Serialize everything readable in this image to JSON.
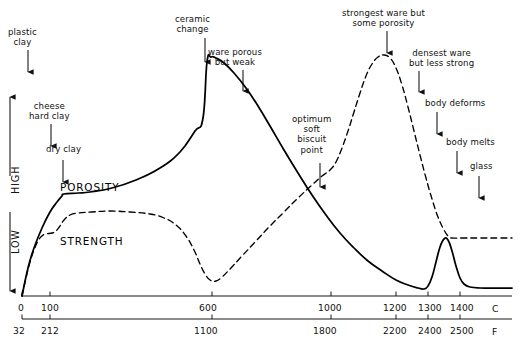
{
  "chart_data": {
    "type": "line",
    "title": "",
    "xlabel": "",
    "ylabel": "",
    "grid": false,
    "legend_position": "inline-curve-labels",
    "axes": {
      "x_primary": {
        "unit": "C",
        "ticks": [
          0,
          100,
          600,
          1000,
          1200,
          1300,
          1400
        ],
        "tick_labels": [
          "0",
          "100",
          "600",
          "1000",
          "1200",
          "1300",
          "1400"
        ],
        "range": [
          -40,
          1500
        ]
      },
      "x_secondary": {
        "unit": "F",
        "ticks": [
          32,
          212,
          1100,
          1800,
          2200,
          2400,
          2500
        ],
        "tick_labels": [
          "32",
          "212",
          "1100",
          "1800",
          "2200",
          "2400",
          "2500"
        ]
      },
      "y": {
        "low_label": "LOW",
        "high_label": "HIGH",
        "range": [
          0,
          1
        ]
      }
    },
    "series": [
      {
        "name": "POROSITY",
        "style": "solid",
        "color": "#000000",
        "label_x": 60,
        "label_y": 181,
        "points": [
          [
            22,
            296
          ],
          [
            28,
            268
          ],
          [
            34,
            248
          ],
          [
            42,
            228
          ],
          [
            50,
            212
          ],
          [
            57,
            202
          ],
          [
            62,
            196
          ],
          [
            64,
            194
          ],
          [
            78,
            193
          ],
          [
            90,
            192
          ],
          [
            112,
            188
          ],
          [
            136,
            180
          ],
          [
            160,
            168
          ],
          [
            180,
            152
          ],
          [
            195,
            131
          ],
          [
            203,
            118
          ],
          [
            207,
            62
          ],
          [
            211,
            57
          ],
          [
            216,
            58
          ],
          [
            224,
            63
          ],
          [
            234,
            73
          ],
          [
            246,
            88
          ],
          [
            258,
            106
          ],
          [
            270,
            126
          ],
          [
            284,
            150
          ],
          [
            298,
            173
          ],
          [
            312,
            195
          ],
          [
            326,
            215
          ],
          [
            340,
            233
          ],
          [
            354,
            248
          ],
          [
            368,
            261
          ],
          [
            382,
            271
          ],
          [
            396,
            280
          ],
          [
            408,
            285
          ],
          [
            418,
            288
          ],
          [
            424,
            289
          ],
          [
            428,
            286
          ],
          [
            432,
            277
          ],
          [
            436,
            262
          ],
          [
            440,
            247
          ],
          [
            444,
            239
          ],
          [
            448,
            240
          ],
          [
            452,
            251
          ],
          [
            456,
            266
          ],
          [
            460,
            278
          ],
          [
            464,
            284
          ],
          [
            470,
            287
          ],
          [
            480,
            288
          ],
          [
            495,
            288
          ],
          [
            512,
            288
          ]
        ]
      },
      {
        "name": "STRENGTH",
        "style": "dashed",
        "color": "#000000",
        "label_x": 60,
        "label_y": 235,
        "points": [
          [
            22,
            296
          ],
          [
            26,
            278
          ],
          [
            30,
            262
          ],
          [
            34,
            250
          ],
          [
            38,
            241
          ],
          [
            42,
            236
          ],
          [
            46,
            234
          ],
          [
            52,
            233
          ],
          [
            56,
            231
          ],
          [
            60,
            226
          ],
          [
            64,
            220
          ],
          [
            70,
            215
          ],
          [
            78,
            213
          ],
          [
            92,
            212
          ],
          [
            110,
            211
          ],
          [
            130,
            212
          ],
          [
            150,
            214
          ],
          [
            164,
            218
          ],
          [
            176,
            225
          ],
          [
            186,
            236
          ],
          [
            194,
            250
          ],
          [
            200,
            264
          ],
          [
            205,
            274
          ],
          [
            210,
            280
          ],
          [
            216,
            281
          ],
          [
            222,
            277
          ],
          [
            230,
            269
          ],
          [
            242,
            256
          ],
          [
            256,
            241
          ],
          [
            270,
            226
          ],
          [
            284,
            212
          ],
          [
            298,
            198
          ],
          [
            312,
            185
          ],
          [
            322,
            176
          ],
          [
            330,
            170
          ],
          [
            336,
            162
          ],
          [
            342,
            148
          ],
          [
            348,
            131
          ],
          [
            354,
            112
          ],
          [
            360,
            93
          ],
          [
            366,
            76
          ],
          [
            372,
            64
          ],
          [
            378,
            57
          ],
          [
            384,
            55
          ],
          [
            390,
            58
          ],
          [
            396,
            68
          ],
          [
            402,
            85
          ],
          [
            408,
            107
          ],
          [
            414,
            131
          ],
          [
            420,
            155
          ],
          [
            426,
            178
          ],
          [
            432,
            199
          ],
          [
            438,
            217
          ],
          [
            444,
            230
          ],
          [
            448,
            236
          ],
          [
            452,
            238
          ],
          [
            462,
            238
          ],
          [
            480,
            238
          ],
          [
            500,
            238
          ],
          [
            512,
            238
          ]
        ]
      }
    ],
    "annotations": [
      {
        "name": "plastic-clay",
        "text": "plastic\nclay",
        "text_x": 8,
        "text_y": 27,
        "arrow_x": 28,
        "arrow_top": 50,
        "arrow_bottom": 72
      },
      {
        "name": "cheese-hard-clay",
        "text": "cheese\nhard clay",
        "text_x": 29,
        "text_y": 101,
        "arrow_x": 51,
        "arrow_top": 124,
        "arrow_bottom": 146
      },
      {
        "name": "dry-clay",
        "text": "dry clay",
        "text_x": 46,
        "text_y": 144,
        "arrow_x": 63,
        "arrow_top": 160,
        "arrow_bottom": 182
      },
      {
        "name": "ceramic-change",
        "text": "ceramic\nchange",
        "text_x": 175,
        "text_y": 14,
        "arrow_x": 205,
        "arrow_top": 38,
        "arrow_bottom": 62
      },
      {
        "name": "ware-porous-but-weak",
        "text": "ware porous\nbut weak",
        "text_x": 208,
        "text_y": 47,
        "arrow_x": 243,
        "arrow_top": 70,
        "arrow_bottom": 91
      },
      {
        "name": "optimum-soft-biscuit",
        "text": "optimum\nsoft\nbiscuit\npoint",
        "text_x": 292,
        "text_y": 114,
        "arrow_x": 320,
        "arrow_top": 163,
        "arrow_bottom": 187
      },
      {
        "name": "strongest-ware",
        "text": "strongest ware but\nsome porosity",
        "text_x": 342,
        "text_y": 8,
        "arrow_x": 387,
        "arrow_top": 31,
        "arrow_bottom": 53
      },
      {
        "name": "densest-ware",
        "text": "densest ware\nbut less strong",
        "text_x": 409,
        "text_y": 48,
        "arrow_x": 419,
        "arrow_top": 71,
        "arrow_bottom": 92
      },
      {
        "name": "body-deforms",
        "text": "body deforms",
        "text_x": 425,
        "text_y": 98,
        "arrow_x": 437,
        "arrow_top": 112,
        "arrow_bottom": 134
      },
      {
        "name": "body-melts",
        "text": "body melts",
        "text_x": 446,
        "text_y": 137,
        "arrow_x": 457,
        "arrow_top": 151,
        "arrow_bottom": 173
      },
      {
        "name": "glass",
        "text": "glass",
        "text_x": 470,
        "text_y": 161,
        "arrow_x": 479,
        "arrow_top": 176,
        "arrow_bottom": 198
      }
    ]
  },
  "axis_numbers_c": [
    {
      "label": "0",
      "x": 18,
      "tick_x": 22
    },
    {
      "label": "100",
      "x": 41,
      "tick_x": 50
    },
    {
      "label": "600",
      "x": 199,
      "tick_x": 212
    },
    {
      "label": "1000",
      "x": 318,
      "tick_x": 331
    },
    {
      "label": "1200",
      "x": 383,
      "tick_x": 396
    },
    {
      "label": "1300",
      "x": 418,
      "tick_x": 428
    },
    {
      "label": "1400",
      "x": 450,
      "tick_x": 460
    }
  ],
  "axis_numbers_f": [
    {
      "label": "32",
      "x": 13,
      "tick_x": 22
    },
    {
      "label": "212",
      "x": 41,
      "tick_x": 50
    },
    {
      "label": "1100",
      "x": 194,
      "tick_x": 212
    },
    {
      "label": "1800",
      "x": 313,
      "tick_x": 331
    },
    {
      "label": "2200",
      "x": 383,
      "tick_x": 396
    },
    {
      "label": "2400",
      "x": 418,
      "tick_x": 428
    },
    {
      "label": "2500",
      "x": 450,
      "tick_x": 460
    }
  ],
  "units": {
    "celsius": "C",
    "fahrenheit": "F"
  },
  "y_axis": {
    "high": "HIGH",
    "low": "LOW"
  },
  "curve_labels": {
    "porosity": "POROSITY",
    "strength": "STRENGTH"
  },
  "colors": {
    "curve": "#000000",
    "axis": "#1a1a1a",
    "text": "#111111",
    "background": "#ffffff"
  }
}
